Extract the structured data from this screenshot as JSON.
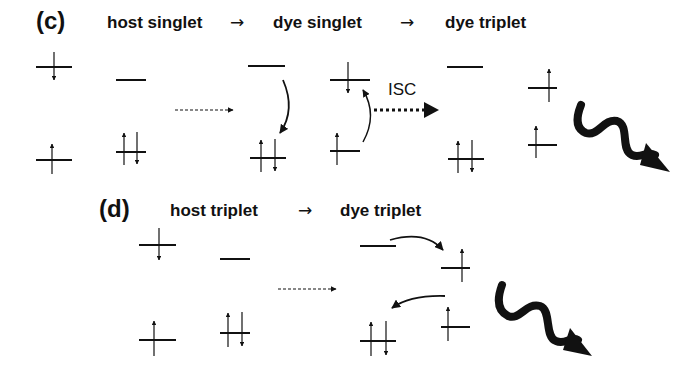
{
  "panels": [
    {
      "id": "c",
      "label": "(c)",
      "states": [
        "host singlet",
        "dye singlet",
        "dye triplet"
      ],
      "transition_arrow": "→",
      "process_label": "ISC",
      "emission": "wavy-arrow"
    },
    {
      "id": "d",
      "label": "(d)",
      "states": [
        "host triplet",
        "dye triplet"
      ],
      "transition_arrow": "→",
      "emission": "wavy-arrow"
    }
  ],
  "colors": {
    "ink": "#111111",
    "background": "#ffffff"
  }
}
